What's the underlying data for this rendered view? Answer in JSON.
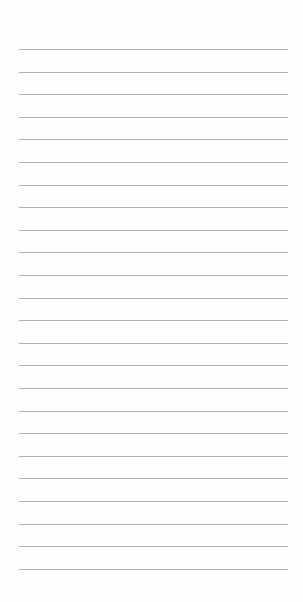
{
  "page": {
    "type": "lined-notepad",
    "background_color": "#fefefe",
    "line_color": "#9a9a9a",
    "line_count": 24,
    "first_line_y": 49,
    "line_spacing": 22.6,
    "line_left": 19,
    "line_width": 269
  }
}
